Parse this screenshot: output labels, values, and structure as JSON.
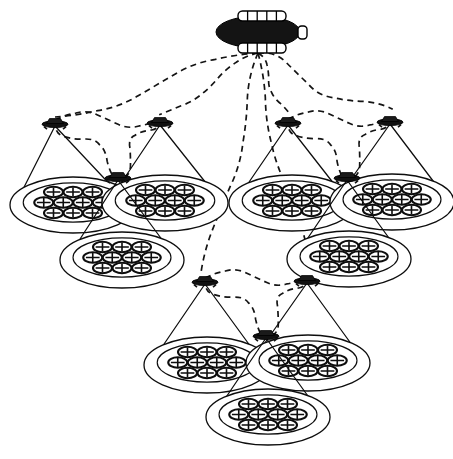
{
  "figure": {
    "background_color": "#ffffff",
    "ink_color": "#0d0d0d",
    "width": 453,
    "height": 459,
    "style": "black-and-white line drawing"
  },
  "airship": {
    "name": "haps-airship",
    "label": "High Altitude Platform Station airship",
    "center": {
      "x": 258,
      "y": 32
    },
    "hull": {
      "rx": 42,
      "ry": 16,
      "fill": "#141414"
    },
    "panels": [
      {
        "name": "upper-solar-array",
        "x": 238,
        "y": 11,
        "w": 48,
        "h": 10,
        "ribs": 5
      },
      {
        "name": "lower-solar-array",
        "x": 238,
        "y": 43,
        "w": 48,
        "h": 10,
        "ribs": 5
      }
    ],
    "tail": {
      "name": "tail-fin",
      "x": 298,
      "y": 26,
      "w": 9,
      "h": 13
    },
    "downlink_origin": {
      "x": 258,
      "y": 53
    }
  },
  "groups": [
    {
      "name": "cluster-left",
      "label": "Left UAV cluster",
      "nodes": [
        {
          "name": "uav-left-a",
          "x": 55,
          "y": 122,
          "foot": {
            "cx": 73,
            "cy": 205,
            "rx": 63,
            "ry": 28
          },
          "half_width": 60
        },
        {
          "name": "uav-left-b",
          "x": 160,
          "y": 121,
          "foot": {
            "cx": 165,
            "cy": 203,
            "rx": 63,
            "ry": 28
          },
          "half_width": 60
        },
        {
          "name": "uav-left-c",
          "x": 118,
          "y": 176,
          "foot": {
            "cx": 122,
            "cy": 260,
            "rx": 62,
            "ry": 28
          },
          "half_width": 58
        }
      ],
      "mesh_links": [
        {
          "from": "uav-left-a",
          "to": "uav-left-b"
        },
        {
          "from": "uav-left-a",
          "to": "uav-left-c"
        },
        {
          "from": "uav-left-b",
          "to": "uav-left-c"
        }
      ]
    },
    {
      "name": "cluster-right",
      "label": "Right UAV cluster",
      "nodes": [
        {
          "name": "uav-right-a",
          "x": 288,
          "y": 121,
          "foot": {
            "cx": 292,
            "cy": 203,
            "rx": 63,
            "ry": 28
          },
          "half_width": 60
        },
        {
          "name": "uav-right-b",
          "x": 390,
          "y": 120,
          "foot": {
            "cx": 392,
            "cy": 202,
            "rx": 62,
            "ry": 28
          },
          "half_width": 60
        },
        {
          "name": "uav-right-c",
          "x": 347,
          "y": 176,
          "foot": {
            "cx": 349,
            "cy": 259,
            "rx": 62,
            "ry": 28
          },
          "half_width": 58
        }
      ],
      "mesh_links": [
        {
          "from": "uav-right-a",
          "to": "uav-right-b"
        },
        {
          "from": "uav-right-a",
          "to": "uav-right-c"
        },
        {
          "from": "uav-right-b",
          "to": "uav-right-c"
        }
      ]
    },
    {
      "name": "cluster-bottom",
      "label": "Bottom UAV cluster",
      "nodes": [
        {
          "name": "uav-bottom-a",
          "x": 205,
          "y": 280,
          "foot": {
            "cx": 207,
            "cy": 365,
            "rx": 63,
            "ry": 28
          },
          "half_width": 60
        },
        {
          "name": "uav-bottom-b",
          "x": 307,
          "y": 279,
          "foot": {
            "cx": 308,
            "cy": 363,
            "rx": 62,
            "ry": 28
          },
          "half_width": 60
        },
        {
          "name": "uav-bottom-c",
          "x": 266,
          "y": 334,
          "foot": {
            "cx": 268,
            "cy": 417,
            "rx": 62,
            "ry": 28
          },
          "half_width": 58
        }
      ],
      "mesh_links": [
        {
          "from": "uav-bottom-a",
          "to": "uav-bottom-b"
        },
        {
          "from": "uav-bottom-a",
          "to": "uav-bottom-c"
        },
        {
          "from": "uav-bottom-b",
          "to": "uav-bottom-c"
        }
      ]
    }
  ],
  "backhaul_links": [
    {
      "name": "backhaul-to-left-a",
      "target": "uav-left-a",
      "style": "dashed"
    },
    {
      "name": "backhaul-to-left-b",
      "target": "uav-left-b",
      "style": "dashed"
    },
    {
      "name": "backhaul-to-right-a",
      "target": "uav-right-a",
      "style": "dashed"
    },
    {
      "name": "backhaul-to-right-b",
      "target": "uav-right-b",
      "style": "dashed"
    },
    {
      "name": "backhaul-to-bottom-a",
      "target": "uav-bottom-a",
      "style": "dashed"
    },
    {
      "name": "backhaul-to-bottom-b",
      "target": "uav-bottom-b",
      "style": "dashed"
    }
  ],
  "cell_cluster": {
    "name": "cell-honeycomb",
    "label": "Hexagonal cell layout inside each coverage footprint",
    "cells_per_footprint": 10,
    "rows": [
      3,
      4,
      3
    ],
    "cell": {
      "rx": 9.5,
      "ry": 5.2,
      "fill": "#ffffff",
      "stroke": "#0d0d0d"
    },
    "row_spacing_y": 10.5,
    "col_spacing_x": 19.5,
    "row_offset_x": 9.75,
    "sector_marks": "cross"
  },
  "counts": {
    "airships": 1,
    "clusters": 3,
    "uavs_total": 9,
    "footprints_total": 9,
    "cells_total": 90
  }
}
